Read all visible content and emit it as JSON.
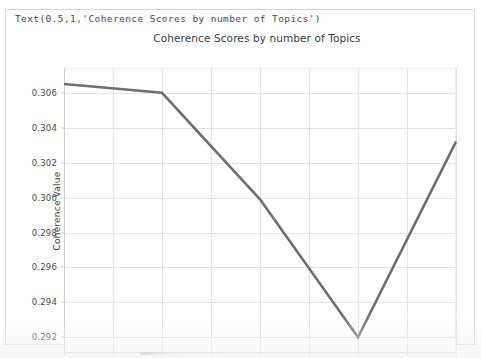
{
  "repr_line": "Text(0.5,1,'Coherence Scores by number of Topics')",
  "chart_data": {
    "type": "line",
    "title": "Coherence Scores by number of Topics",
    "xlabel": "Number of topics",
    "ylabel": "Coherence Value",
    "x": [
      20.0,
      21.0,
      22.0,
      23.0,
      24.0
    ],
    "values": [
      0.3065,
      0.306,
      0.2999,
      0.292,
      0.3032
    ],
    "series": [
      {
        "name": "Coherence Value",
        "values": [
          0.3065,
          0.306,
          0.2999,
          0.292,
          0.3032
        ]
      }
    ],
    "xlim": [
      20.0,
      24.0
    ],
    "ylim": [
      0.2911,
      0.30742
    ],
    "xticks": [
      "20.0",
      "20.5",
      "21.0",
      "21.5",
      "22.0",
      "22.5",
      "23.0",
      "23.5",
      "24.0"
    ],
    "xtick_values": [
      20.0,
      20.5,
      21.0,
      21.5,
      22.0,
      22.5,
      23.0,
      23.5,
      24.0
    ],
    "yticks": [
      "0.292",
      "0.294",
      "0.296",
      "0.298",
      "0.300",
      "0.302",
      "0.304",
      "0.306"
    ],
    "ytick_values": [
      0.292,
      0.294,
      0.296,
      0.298,
      0.3,
      0.302,
      0.304,
      0.306
    ],
    "grid": true,
    "legend": null,
    "line_color": "#6e6e73",
    "grid_color": "#e3e3e3",
    "background": "#ffffff"
  }
}
